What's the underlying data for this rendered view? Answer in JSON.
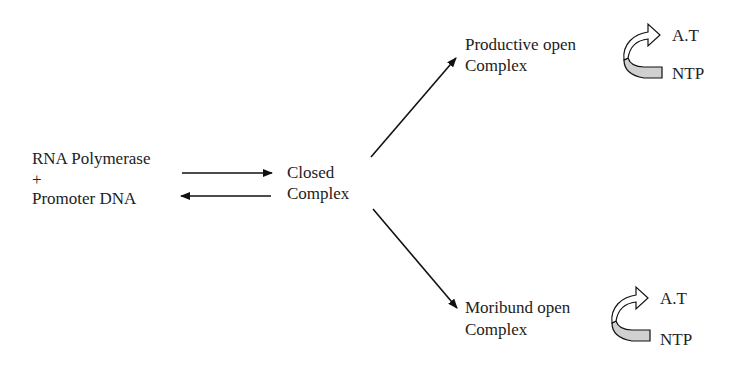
{
  "diagram": {
    "start": {
      "line1": "RNA  Polymerase",
      "line2": "+",
      "line3": "Promoter DNA"
    },
    "closed": {
      "line1": "Closed",
      "line2": "Complex"
    },
    "productive": {
      "line1": "Productive open",
      "line2": "Complex",
      "out": "A.T",
      "in": "NTP"
    },
    "moribund": {
      "line1": "Moribund open",
      "line2": "Complex",
      "out": "A.T",
      "in": "NTP"
    }
  },
  "colors": {
    "stroke": "#111111",
    "fill_shaded": "#d0d0d0"
  }
}
